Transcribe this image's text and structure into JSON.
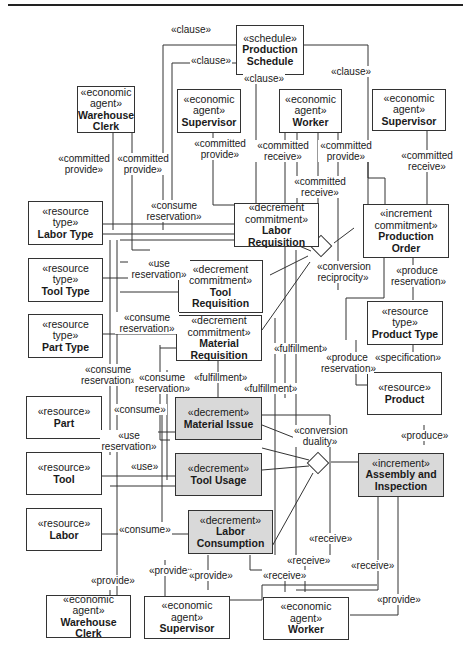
{
  "diagram": {
    "type": "REA value chain / UML-style class diagram",
    "fill_colors": {
      "event_box": "#d9d9d9",
      "default_box": "#ffffff",
      "line": "#333333"
    },
    "boxes": {
      "production_schedule": {
        "stereotype": "«schedule»",
        "name": "Production Schedule"
      },
      "warehouse_clerk_top": {
        "stereotype": "«economic agent»",
        "name": "Warehouse Clerk"
      },
      "supervisor_top_left": {
        "stereotype": "«economic agent»",
        "name": "Supervisor"
      },
      "worker_top": {
        "stereotype": "«economic agent»",
        "name": "Worker"
      },
      "supervisor_top_right": {
        "stereotype": "«economic agent»",
        "name": "Supervisor"
      },
      "labor_type": {
        "stereotype": "«resource type»",
        "name": "Labor Type"
      },
      "tool_type": {
        "stereotype": "«resource type»",
        "name": "Tool Type"
      },
      "part_type": {
        "stereotype": "«resource type»",
        "name": "Part Type"
      },
      "labor_requisition": {
        "stereotype": "«decrement commitment»",
        "name": "Labor Requisition"
      },
      "tool_requisition": {
        "stereotype": "«decrement commitment»",
        "name": "Tool Requisition"
      },
      "material_requisition": {
        "stereotype": "«decrement commitment»",
        "name": "Material Requisition"
      },
      "production_order": {
        "stereotype": "«increment commitment»",
        "name": "Production Order"
      },
      "product_type": {
        "stereotype": "«resource type»",
        "name": "Product Type"
      },
      "product": {
        "stereotype": "«resource»",
        "name": "Product"
      },
      "part": {
        "stereotype": "«resource»",
        "name": "Part"
      },
      "tool": {
        "stereotype": "«resource»",
        "name": "Tool"
      },
      "labor": {
        "stereotype": "«resource»",
        "name": "Labor"
      },
      "material_issue": {
        "stereotype": "«decrement»",
        "name": "Material Issue"
      },
      "tool_usage": {
        "stereotype": "«decrement»",
        "name": "Tool Usage"
      },
      "labor_consumption": {
        "stereotype": "«decrement»",
        "name": "Labor Consumption"
      },
      "assembly_inspection": {
        "stereotype": "«increment»",
        "name": "Assembly and Inspection"
      },
      "warehouse_clerk_bottom": {
        "stereotype": "«economic agent»",
        "name": "Warehouse Clerk"
      },
      "supervisor_bottom": {
        "stereotype": "«economic agent»",
        "name": "Supervisor"
      },
      "worker_bottom": {
        "stereotype": "«economic agent»",
        "name": "Worker"
      }
    },
    "labels": {
      "clause_1": "«clause»",
      "clause_2": "«clause»",
      "clause_3": "«clause»",
      "clause_4": "«clause»",
      "committed_provide_1": "«committed provide»",
      "committed_provide_2": "«committed provide»",
      "committed_provide_3": "«committed provide»",
      "committed_receive_1": "«committed receive»",
      "committed_provide_4": "«committed provide»",
      "committed_receive_2": "«committed receive»",
      "committed_receive_3": "«committed receive»",
      "consume_reservation_1": "«consume reservation»",
      "use_reservation_1": "«use reservation»",
      "consume_reservation_2": "«consume reservation»",
      "consume_reservation_3": "«consume reservation»",
      "consume_reservation_4": "«consume reservation»",
      "conversion_reciprocity": "«conversion reciprocity»",
      "produce_reservation_1": "«produce reservation»",
      "produce_reservation_2": "«produce reservation»",
      "specification": "«specification»",
      "fulfillment_1": "«fulfillment»",
      "fulfillment_2": "«fulfillment»",
      "fulfillment_3": "«fulfillment»",
      "consume_1": "«consume»",
      "use_reservation_2": "«use reservation»",
      "use": "«use»",
      "consume_2": "«consume»",
      "conversion_duality": "«conversion duality»",
      "produce": "«produce»",
      "provide_1": "«provide»",
      "provide_2": "«provide»",
      "provide_3": "«provide»",
      "receive_1": "«receive»",
      "receive_2": "«receive»",
      "receive_3": "«receive»",
      "receive_4": "«receive»",
      "provide_4": "«provide»"
    }
  }
}
